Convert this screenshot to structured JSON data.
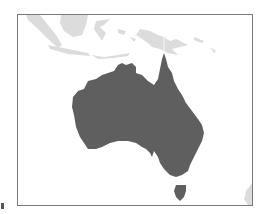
{
  "map": {
    "region": "Australia",
    "highlight_color": "#5f5f5f",
    "context_land_color": "#dcdcdc",
    "background_color": "#ffffff",
    "frame_color": "#7a7a7a",
    "highlighted": [
      "Australia",
      "Tasmania"
    ],
    "context_regions": [
      "Indonesia",
      "Papua New Guinea",
      "New Zealand"
    ]
  }
}
